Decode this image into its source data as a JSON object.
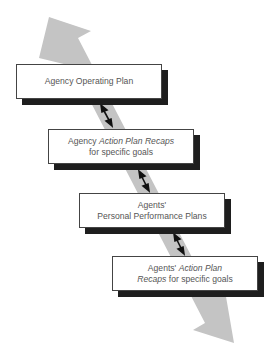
{
  "diagram": {
    "colors": {
      "arrow": "#c4c4c4",
      "box_border": "#444444",
      "shadow": "#1e1e1e",
      "text": "#555555"
    },
    "boxes": [
      {
        "line1": "Agency Operating Plan",
        "line1_italic": "",
        "line2": "",
        "line2_italic": ""
      },
      {
        "line1": "Agency ",
        "line1_italic": "Action Plan Recaps",
        "line2": "for specific goals",
        "line2_italic": ""
      },
      {
        "line1": "Agents'",
        "line1_italic": "",
        "line2": "Personal Performance Plans",
        "line2_italic": ""
      },
      {
        "line1": "Agents' ",
        "line1_italic": "Action Plan",
        "line2_italic": "Recaps",
        "line2": " for specific goals"
      }
    ],
    "connectors": [
      "two-way-arrow",
      "two-way-arrow",
      "two-way-arrow"
    ],
    "main_arrow": "bidirectional-diagonal-arrow"
  }
}
